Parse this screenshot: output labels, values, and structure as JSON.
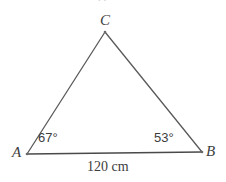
{
  "figure": {
    "kind": "triangle-diagram",
    "background_color": "#ffffff",
    "stroke_color": "#5a5a5a",
    "base_stroke_color": "#4a4a4a",
    "text_color": "#3d3d3d",
    "vertices": {
      "a": {
        "label": "A",
        "x": 27,
        "y": 154
      },
      "b": {
        "label": "B",
        "x": 202,
        "y": 152
      },
      "c": {
        "label": "C",
        "x": 105,
        "y": 32
      }
    },
    "angles": {
      "at_a": "67°",
      "at_b": "53°"
    },
    "sides": {
      "ab": "120 cm"
    },
    "artifact": {
      "clipped_glyph": "B"
    }
  }
}
